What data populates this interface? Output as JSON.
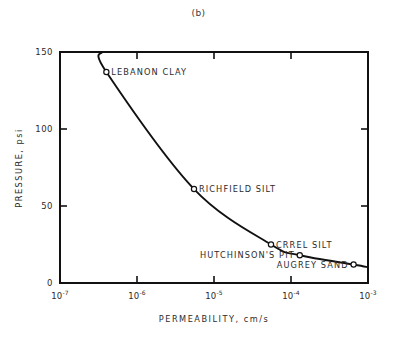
{
  "figure": {
    "caption": "(b)"
  },
  "chart_data": {
    "type": "line",
    "title": "(b)",
    "xlabel": "PERMEABILITY, cm/s",
    "ylabel": "PRESSURE, psi",
    "x_scale": "log",
    "y_scale": "linear",
    "xlim": [
      1e-07,
      0.001
    ],
    "ylim": [
      0,
      150
    ],
    "grid": false,
    "legend_position": "none",
    "x_tick_labels": [
      "10-7",
      "10-6",
      "10-5",
      "10-4",
      "10-3"
    ],
    "x_tick_bases": [
      "10",
      "10",
      "10",
      "10",
      "10"
    ],
    "x_tick_exponents": [
      "-7",
      "-6",
      "-5",
      "-4",
      "-3"
    ],
    "x_tick_values": [
      1e-07,
      1e-06,
      1e-05,
      0.0001,
      0.001
    ],
    "y_tick_labels": [
      "0",
      "50",
      "100",
      "150"
    ],
    "y_tick_values": [
      0,
      50,
      100,
      150
    ],
    "series": [
      {
        "name": "pressure vs permeability",
        "points": [
          {
            "label": "LEBANON CLAY",
            "x": 4e-07,
            "y": 137,
            "label_side": "right"
          },
          {
            "label": "RICHFIELD SILT",
            "x": 5.5e-06,
            "y": 61,
            "label_side": "right"
          },
          {
            "label": "CRREL SILT",
            "x": 5.5e-05,
            "y": 25,
            "label_side": "right"
          },
          {
            "label": "HUTCHINSON'S PIT",
            "x": 0.00013,
            "y": 18,
            "label_side": "left"
          },
          {
            "label": "AUGREY SAND",
            "x": 0.00065,
            "y": 12,
            "label_side": "left"
          }
        ]
      }
    ],
    "marker": "open-circle",
    "line_color": "#111111",
    "axis_color": "#111111"
  }
}
